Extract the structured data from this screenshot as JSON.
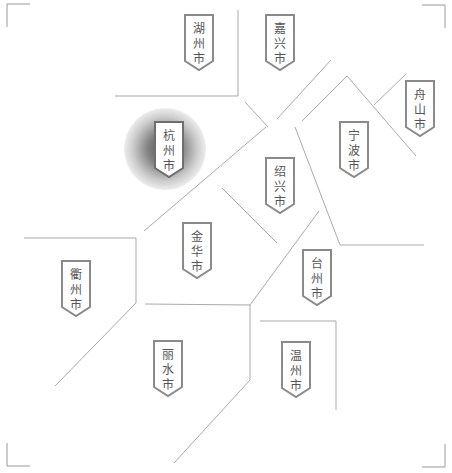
{
  "map": {
    "region": "浙江省",
    "line_color": "#a9a9a9",
    "tag_border_color": "#8a8a8a",
    "highlight_color": "#555555",
    "selected_city": "杭州市",
    "cities": [
      {
        "id": "huzhou",
        "name": "湖州市",
        "chars": [
          "湖",
          "州",
          "市"
        ],
        "x": 184,
        "y": 14
      },
      {
        "id": "jiaxing",
        "name": "嘉兴市",
        "chars": [
          "嘉",
          "兴",
          "市"
        ],
        "x": 265,
        "y": 14
      },
      {
        "id": "zhoushan",
        "name": "舟山市",
        "chars": [
          "舟",
          "山",
          "市"
        ],
        "x": 405,
        "y": 80
      },
      {
        "id": "hangzhou",
        "name": "杭州市",
        "chars": [
          "杭",
          "州",
          "市"
        ],
        "x": 154,
        "y": 121,
        "selected": true
      },
      {
        "id": "ningbo",
        "name": "宁波市",
        "chars": [
          "宁",
          "波",
          "市"
        ],
        "x": 339,
        "y": 121
      },
      {
        "id": "shaoxing",
        "name": "绍兴市",
        "chars": [
          "绍",
          "兴",
          "市"
        ],
        "x": 265,
        "y": 157
      },
      {
        "id": "jinhua",
        "name": "金华市",
        "chars": [
          "金",
          "华",
          "市"
        ],
        "x": 182,
        "y": 222
      },
      {
        "id": "taizhou",
        "name": "台州市",
        "chars": [
          "台",
          "州",
          "市"
        ],
        "x": 302,
        "y": 249
      },
      {
        "id": "quzhou",
        "name": "衢州市",
        "chars": [
          "衢",
          "州",
          "市"
        ],
        "x": 61,
        "y": 260
      },
      {
        "id": "lishui",
        "name": "丽水市",
        "chars": [
          "丽",
          "水",
          "市"
        ],
        "x": 153,
        "y": 340
      },
      {
        "id": "wenzhou",
        "name": "温州市",
        "chars": [
          "温",
          "州",
          "市"
        ],
        "x": 281,
        "y": 341
      }
    ]
  }
}
